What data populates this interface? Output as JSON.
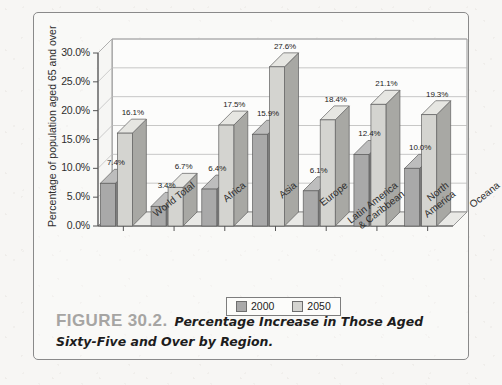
{
  "figure": {
    "label": "FIGURE 30.2.",
    "caption": "Percentage Increase in Those Aged Sixty-Five and Over by Region."
  },
  "legend": {
    "position": "bottom-center",
    "entries": [
      {
        "label": "2000",
        "color": "#a9a9a9"
      },
      {
        "label": "2050",
        "color": "#d4d4d0"
      }
    ]
  },
  "chart_data": {
    "type": "bar",
    "title": "",
    "xlabel": "",
    "ylabel": "Percentage of population aged 65 and over",
    "ylim": [
      0,
      30
    ],
    "ytick_labels": [
      "0.0%",
      "5.0%",
      "10.0%",
      "15.0%",
      "20.0%",
      "25.0%",
      "30.0%"
    ],
    "ytick_values": [
      0,
      5,
      10,
      15,
      20,
      25,
      30
    ],
    "grid": true,
    "grid_axis": "y",
    "style": "3d-clustered-column",
    "categories": [
      "World Total",
      "Africa",
      "Asia",
      "Europe",
      "Latin America\n& Caribbean",
      "North\nAmerica",
      "Oceana"
    ],
    "series": [
      {
        "name": "2000",
        "color": "#a9a9a9",
        "values": [
          7.4,
          3.4,
          6.4,
          15.9,
          6.1,
          12.4,
          10.0
        ],
        "labels": [
          "7.4%",
          "3.4%",
          "6.4%",
          "15.9%",
          "6.1%",
          "12.4%",
          "10.0%"
        ]
      },
      {
        "name": "2050",
        "color": "#d4d4d0",
        "values": [
          16.1,
          6.7,
          17.5,
          27.6,
          18.4,
          21.1,
          19.3
        ],
        "labels": [
          "16.1%",
          "6.7%",
          "17.5%",
          "27.6%",
          "18.4%",
          "21.1%",
          "19.3%"
        ]
      }
    ]
  }
}
